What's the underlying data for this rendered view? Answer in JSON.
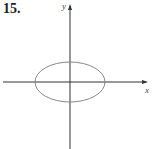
{
  "problem": {
    "number": "15."
  },
  "axes": {
    "x_label": "x",
    "y_label": "y"
  },
  "graph": {
    "shape": "ellipse",
    "center": [
      70,
      82
    ],
    "rx": 35,
    "ry": 20,
    "stroke_color": "#888888",
    "axis_color": "#333333"
  }
}
